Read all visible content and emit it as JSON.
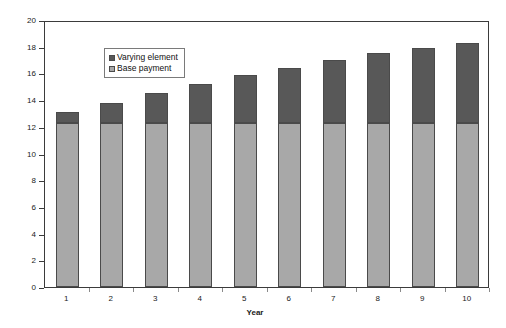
{
  "chart_data": {
    "type": "bar",
    "stacked": true,
    "title": "",
    "xlabel": "Year",
    "ylabel": "Cash flow value",
    "categories": [
      "1",
      "2",
      "3",
      "4",
      "5",
      "6",
      "7",
      "8",
      "9",
      "10"
    ],
    "ylim": [
      0,
      20
    ],
    "ytick_labels": [
      "0",
      "2",
      "4",
      "6",
      "8",
      "10",
      "12",
      "14",
      "16",
      "18",
      "20"
    ],
    "ytick_values": [
      0,
      2,
      4,
      6,
      8,
      10,
      12,
      14,
      16,
      18,
      20
    ],
    "grid": false,
    "legend_position": "upper left",
    "series": [
      {
        "name": "Base payment",
        "color": "#a8a8a8",
        "values": [
          12.3,
          12.3,
          12.3,
          12.3,
          12.3,
          12.3,
          12.3,
          12.3,
          12.3,
          12.3
        ]
      },
      {
        "name": "Varying element",
        "color": "#585858",
        "values": [
          0.8,
          1.5,
          2.2,
          2.9,
          3.6,
          4.1,
          4.7,
          5.2,
          5.6,
          6.0
        ]
      }
    ],
    "totals": [
      13.1,
      13.8,
      14.5,
      15.2,
      15.9,
      16.4,
      17.0,
      17.5,
      17.9,
      18.3
    ]
  },
  "legend": {
    "items": [
      {
        "label": "Varying element",
        "color": "#585858"
      },
      {
        "label": "Base payment",
        "color": "#a8a8a8"
      }
    ]
  },
  "axes": {
    "y_title": "Cash flow value",
    "x_title": "Year"
  }
}
